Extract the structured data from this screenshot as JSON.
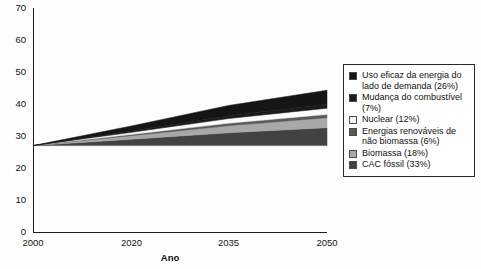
{
  "chart_data": {
    "type": "area",
    "title": "",
    "subtitle": "",
    "xlabel": "Ano",
    "ylabel": "",
    "x": [
      2000,
      2020,
      2035,
      2050
    ],
    "xlim": [
      2000,
      2050
    ],
    "ylim": [
      0,
      70
    ],
    "ytick_values": [
      0,
      10,
      20,
      30,
      40,
      50,
      60,
      70
    ],
    "xtick_labels": [
      "2000",
      "2020",
      "2035",
      "2050"
    ],
    "grid": false,
    "stacked": true,
    "baseline": 27,
    "legend_position": "right",
    "note": "Wedge (stabilization-triangle) chart: all series converge to the baseline value at year 2000 and widen toward 2050. Values are cumulative band thicknesses in the chart's y-units.",
    "series": [
      {
        "name": "Uso eficaz da energia do lado de demanda (26%)",
        "short_name": "Uso eficaz da energia do lado de demanda",
        "share_percent": 26,
        "color": "#151515",
        "values": [
          0.0,
          1.6,
          3.2,
          4.4
        ]
      },
      {
        "name": "Mudança do combustível (7%)",
        "short_name": "Mudança do combustível",
        "share_percent": 7,
        "color": "#1b1b1b",
        "values": [
          0.0,
          0.4,
          0.9,
          1.2
        ]
      },
      {
        "name": "Nuclear (12%)",
        "short_name": "Nuclear",
        "share_percent": 12,
        "color": "#fbfbfb",
        "values": [
          0.0,
          0.7,
          1.5,
          2.0
        ]
      },
      {
        "name": "Energias renováveis de não biomassa (6%)",
        "short_name": "Energias renováveis de não biomassa",
        "share_percent": 6,
        "color": "#595959",
        "values": [
          0.0,
          0.35,
          0.75,
          1.0
        ]
      },
      {
        "name": "Biomassa (18%)",
        "short_name": "Biomassa",
        "share_percent": 18,
        "color": "#a8a8a8",
        "values": [
          0.0,
          1.1,
          2.2,
          3.1
        ]
      },
      {
        "name": "CAC fóssil (33%)",
        "short_name": "CAC fóssil",
        "share_percent": 33,
        "color": "#424242",
        "values": [
          0.0,
          2.0,
          4.0,
          5.6
        ]
      }
    ],
    "total_top": [
      27.0,
      33.15,
      39.55,
      44.3
    ]
  },
  "legend": {
    "items": [
      {
        "label": "Uso eficaz da energia do lado de demanda (26%)",
        "swatch": "#151515"
      },
      {
        "label": "Mudança do combustível (7%)",
        "swatch": "#1b1b1b"
      },
      {
        "label": "Nuclear (12%)",
        "swatch": "#fbfbfb"
      },
      {
        "label": "Energias renováveis de não biomassa (6%)",
        "swatch": "#595959"
      },
      {
        "label": "Biomassa (18%)",
        "swatch": "#a8a8a8"
      },
      {
        "label": "CAC fóssil (33%)",
        "swatch": "#424242"
      }
    ]
  }
}
